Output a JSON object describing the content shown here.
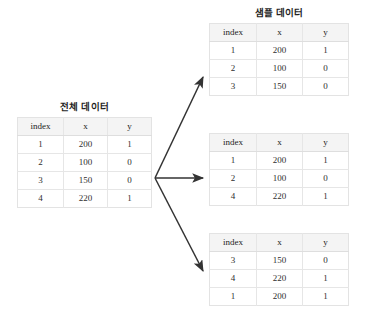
{
  "figure": {
    "background_color": "#ffffff",
    "line_color": "#333333",
    "header_background": "#f4f4f4",
    "border_color": "#e3e3e3"
  },
  "columns": [
    "index",
    "x",
    "y"
  ],
  "source_table": {
    "title": "전체 데이터",
    "columns": [
      "index",
      "x",
      "y"
    ],
    "rows": [
      [
        "1",
        "200",
        "1"
      ],
      [
        "2",
        "100",
        "0"
      ],
      [
        "3",
        "150",
        "0"
      ],
      [
        "4",
        "220",
        "1"
      ]
    ]
  },
  "sample_tables": [
    {
      "title": "샘플 데이터",
      "columns": [
        "index",
        "x",
        "y"
      ],
      "rows": [
        [
          "1",
          "200",
          "1"
        ],
        [
          "2",
          "100",
          "0"
        ],
        [
          "3",
          "150",
          "0"
        ]
      ]
    },
    {
      "title": "",
      "columns": [
        "index",
        "x",
        "y"
      ],
      "rows": [
        [
          "1",
          "200",
          "1"
        ],
        [
          "2",
          "100",
          "0"
        ],
        [
          "4",
          "220",
          "1"
        ]
      ]
    },
    {
      "title": "",
      "columns": [
        "index",
        "x",
        "y"
      ],
      "rows": [
        [
          "3",
          "150",
          "0"
        ],
        [
          "4",
          "220",
          "1"
        ],
        [
          "1",
          "200",
          "1"
        ]
      ]
    }
  ],
  "arrows": [
    {
      "name": "arrow-to-sample-1",
      "from": [
        155,
        178
      ],
      "to": [
        204,
        76
      ]
    },
    {
      "name": "arrow-to-sample-2",
      "from": [
        155,
        178
      ],
      "to": [
        204,
        178
      ]
    },
    {
      "name": "arrow-to-sample-3",
      "from": [
        155,
        178
      ],
      "to": [
        204,
        272
      ]
    }
  ]
}
